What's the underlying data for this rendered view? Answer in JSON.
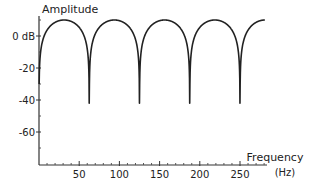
{
  "chart_data": {
    "type": "line",
    "title": "",
    "ylabel": "Amplitude",
    "xlabel": "Frequency",
    "xunit": "(Hz)",
    "x_ticks": [
      50,
      100,
      150,
      200,
      250
    ],
    "x_tick_labels": [
      "50",
      "100",
      "150",
      "200",
      "250"
    ],
    "y_ticks": [
      0,
      -20,
      -40,
      -60
    ],
    "y_tick_labels": [
      "0 dB",
      "-20",
      "-40",
      "-60"
    ],
    "xlim": [
      0,
      290
    ],
    "ylim": [
      -80,
      12
    ],
    "grid": false,
    "legend": null,
    "series": [
      {
        "name": "Comb filter response",
        "x": [
          0,
          10,
          20,
          31.25,
          42,
          52,
          58,
          62.5,
          67,
          73,
          83,
          93.75,
          104,
          114,
          120,
          125,
          130,
          136,
          146,
          156.25,
          167,
          177,
          183,
          187.5,
          192,
          198,
          208,
          218.75,
          229,
          239,
          245,
          250,
          255,
          261,
          271,
          281
        ],
        "values": [
          -78,
          -2,
          6,
          10,
          6,
          -6,
          -20,
          -78,
          -20,
          -6,
          6,
          10,
          6,
          -6,
          -20,
          -78,
          -20,
          -6,
          6,
          10,
          6,
          -6,
          -20,
          -78,
          -20,
          -6,
          6,
          10,
          6,
          -6,
          -20,
          -78,
          -20,
          -6,
          6,
          10
        ]
      }
    ],
    "peaks_hz": [
      31.25,
      93.75,
      156.25,
      218.75
    ],
    "nulls_hz": [
      62.5,
      125,
      187.5,
      250
    ]
  },
  "axes": {
    "y_title": "Amplitude",
    "x_title": "Frequency",
    "x_unit": "(Hz)",
    "y_ticks": [
      {
        "label": "0 dB",
        "value": 0
      },
      {
        "label": "-20",
        "value": -20
      },
      {
        "label": "-40",
        "value": -40
      },
      {
        "label": "-60",
        "value": -60
      }
    ],
    "x_ticks": [
      {
        "label": "50",
        "value": 50
      },
      {
        "label": "100",
        "value": 100
      },
      {
        "label": "150",
        "value": 150
      },
      {
        "label": "200",
        "value": 200
      },
      {
        "label": "250",
        "value": 250
      }
    ]
  },
  "colors": {
    "line": "#222222",
    "axis": "#333333",
    "background": "#ffffff"
  }
}
